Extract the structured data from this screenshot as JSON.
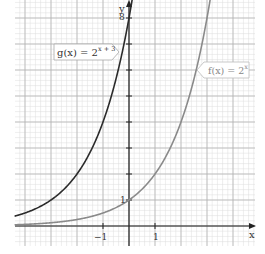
{
  "chart_data": {
    "type": "line",
    "title": "",
    "xlabel": "x",
    "ylabel": "y",
    "xlim": [
      -4.4,
      4.9
    ],
    "ylim": [
      -0.7,
      8.7
    ],
    "x_ticks_labeled": [
      -1,
      1
    ],
    "y_ticks_labeled": [
      1,
      8
    ],
    "grid": true,
    "series": [
      {
        "name": "g(x) = 2^(x+3)",
        "color": "#2b2b2b",
        "x": [
          -4.4,
          -4,
          -3,
          -2,
          -1,
          0
        ],
        "values": [
          0.38,
          0.5,
          1,
          2,
          4,
          8
        ]
      },
      {
        "name": "f(x) = 2^x",
        "color": "#8a8a8a",
        "x": [
          -4.4,
          -2,
          -1,
          0,
          1,
          2,
          3
        ],
        "values": [
          0.05,
          0.25,
          0.5,
          1,
          2,
          4,
          8
        ]
      }
    ],
    "annotations": [
      {
        "text": "g(x) = 2^(x+3)",
        "points_to": "g curve near y=6"
      },
      {
        "text": "f(x) = 2^x",
        "points_to": "f curve near y=5"
      }
    ]
  },
  "labels": {
    "g_label_base": "g(x) = 2",
    "g_label_exp": "x + 3",
    "f_label_base": "f(x) = 2",
    "f_label_exp": "x",
    "x_axis": "x",
    "y_axis": "y",
    "tick_neg1": "−1",
    "tick_1": "1",
    "y_tick_1": "1",
    "y_tick_8": "8"
  }
}
